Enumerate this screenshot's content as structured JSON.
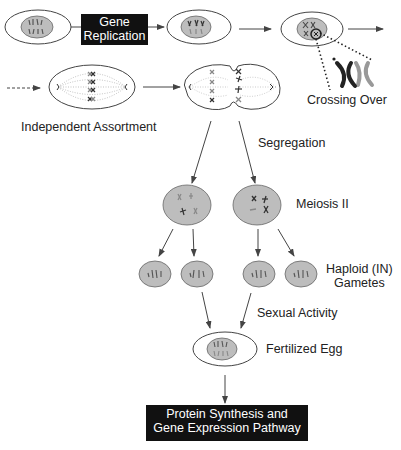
{
  "diagram": {
    "type": "flowchart",
    "topic": "Meiosis and fertilization",
    "boxes": {
      "gene_replication": {
        "line1": "Gene",
        "line2": "Replication"
      },
      "protein_synthesis": {
        "line1": "Protein Synthesis and",
        "line2": "Gene Expression Pathway"
      }
    },
    "labels": {
      "crossing_over": "Crossing Over",
      "independent_assortment": "Independent Assortment",
      "segregation": "Segregation",
      "meiosis_ii": "Meiosis II",
      "haploid_line1": "Haploid (IN)",
      "haploid_line2": "Gametes",
      "sexual_activity": "Sexual Activity",
      "fertilized_egg": "Fertilized Egg"
    },
    "colors": {
      "nucleus_fill": "#bdbdbd",
      "outline": "#333333",
      "box_fill": "#111111",
      "box_text": "#ffffff",
      "chromosome_dark": "#333333",
      "chromosome_light": "#8a8a8a"
    }
  }
}
